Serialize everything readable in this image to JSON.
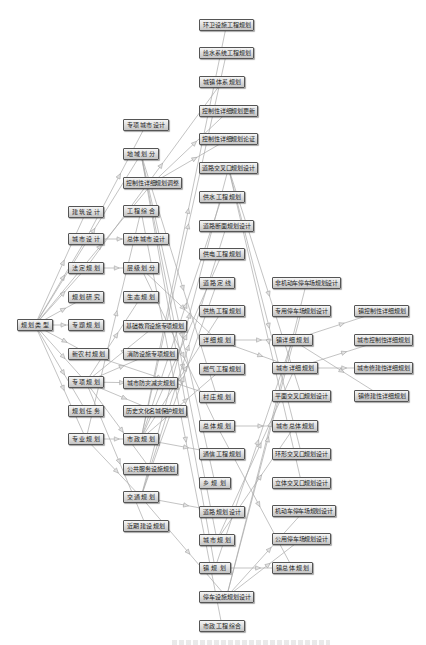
{
  "diagram": {
    "nodes": [
      {
        "id": "r0",
        "label": "规划类型"
      },
      {
        "id": "a1",
        "label": "建筑设计"
      },
      {
        "id": "a2",
        "label": "城市设计"
      },
      {
        "id": "a3",
        "label": "法定规划"
      },
      {
        "id": "a4",
        "label": "规划研究"
      },
      {
        "id": "a5",
        "label": "专题规划"
      },
      {
        "id": "a6",
        "label": "新农村规划"
      },
      {
        "id": "a7",
        "label": "专项规划"
      },
      {
        "id": "a8",
        "label": "规划任务"
      },
      {
        "id": "a9",
        "label": "专业规划"
      },
      {
        "id": "b1",
        "label": "专项城市设计"
      },
      {
        "id": "b2",
        "label": "地域划分"
      },
      {
        "id": "b3",
        "label": "控制性详细规划调整"
      },
      {
        "id": "b4",
        "label": "工程综合"
      },
      {
        "id": "b5",
        "label": "总体城市设计"
      },
      {
        "id": "b6",
        "label": "层级划分"
      },
      {
        "id": "b7",
        "label": "生态规划"
      },
      {
        "id": "b8",
        "label": "基础教育设施专项规划"
      },
      {
        "id": "b9",
        "label": "消防设施专项规划"
      },
      {
        "id": "b10",
        "label": "城市防灾减灾规划"
      },
      {
        "id": "b11",
        "label": "历史文化名城保护规划"
      },
      {
        "id": "b12",
        "label": "市政规划"
      },
      {
        "id": "b13",
        "label": "公共服务设施规划"
      },
      {
        "id": "b14",
        "label": "交通规划"
      },
      {
        "id": "b15",
        "label": "近期建设规划"
      },
      {
        "id": "c1",
        "label": "环卫设施工程规划"
      },
      {
        "id": "c2",
        "label": "给水系统工程规划"
      },
      {
        "id": "c3",
        "label": "城镇体系规划"
      },
      {
        "id": "c4",
        "label": "控制性详细规划更新"
      },
      {
        "id": "c5",
        "label": "控制性详细规划论证"
      },
      {
        "id": "c6",
        "label": "道路交叉口规划设计"
      },
      {
        "id": "c7",
        "label": "供水工程规划"
      },
      {
        "id": "c8",
        "label": "道路断面规划设计"
      },
      {
        "id": "c9",
        "label": "供电工程规划"
      },
      {
        "id": "c10",
        "label": "道路定线"
      },
      {
        "id": "c11",
        "label": "供热工程规划"
      },
      {
        "id": "c12",
        "label": "详细规划"
      },
      {
        "id": "c13",
        "label": "燃气工程规划"
      },
      {
        "id": "c14",
        "label": "村庄规划"
      },
      {
        "id": "c15",
        "label": "总体规划"
      },
      {
        "id": "c16",
        "label": "通信工程规划"
      },
      {
        "id": "c17",
        "label": "乡规划"
      },
      {
        "id": "c18",
        "label": "道路规划设计"
      },
      {
        "id": "c19",
        "label": "城市规划"
      },
      {
        "id": "c20",
        "label": "镇规划"
      },
      {
        "id": "c21",
        "label": "停车设施规划设计"
      },
      {
        "id": "c22",
        "label": "市政工程综合"
      },
      {
        "id": "d1",
        "label": "非机动车停车场规划设计"
      },
      {
        "id": "d2",
        "label": "专用停车场规划设计"
      },
      {
        "id": "d3",
        "label": "镇详细规划"
      },
      {
        "id": "d4",
        "label": "城市详细规划"
      },
      {
        "id": "d5",
        "label": "平面交叉口规划设计"
      },
      {
        "id": "d6",
        "label": "城市总体规划"
      },
      {
        "id": "d7",
        "label": "环形交叉口规划设计"
      },
      {
        "id": "d8",
        "label": "立体交叉口规划设计"
      },
      {
        "id": "d9",
        "label": "机动车停车场规划设计"
      },
      {
        "id": "d10",
        "label": "公用停车场规划设计"
      },
      {
        "id": "d11",
        "label": "镇总体规划"
      },
      {
        "id": "e1",
        "label": "镇控制性详细规划"
      },
      {
        "id": "e2",
        "label": "城市控制性详细规划"
      },
      {
        "id": "e3",
        "label": "城市修建性详细规划"
      },
      {
        "id": "e4",
        "label": "镇修建性详细规划"
      }
    ],
    "edges": [
      [
        "r0",
        "a1"
      ],
      [
        "r0",
        "a2"
      ],
      [
        "r0",
        "a3"
      ],
      [
        "r0",
        "a4"
      ],
      [
        "r0",
        "a5"
      ],
      [
        "r0",
        "a6"
      ],
      [
        "r0",
        "a7"
      ],
      [
        "r0",
        "a8"
      ],
      [
        "r0",
        "a9"
      ],
      [
        "r0",
        "b2"
      ],
      [
        "r0",
        "b3"
      ],
      [
        "a2",
        "b5"
      ],
      [
        "a2",
        "b1"
      ],
      [
        "a3",
        "b6"
      ],
      [
        "a3",
        "c3"
      ],
      [
        "a6",
        "c14"
      ],
      [
        "a7",
        "b7"
      ],
      [
        "a7",
        "b8"
      ],
      [
        "a7",
        "b9"
      ],
      [
        "a7",
        "b10"
      ],
      [
        "a7",
        "b11"
      ],
      [
        "a7",
        "b13"
      ],
      [
        "a7",
        "b15"
      ],
      [
        "a9",
        "b12"
      ],
      [
        "a9",
        "b14"
      ],
      [
        "a9",
        "b4"
      ],
      [
        "b2",
        "c19"
      ],
      [
        "b2",
        "c20"
      ],
      [
        "b2",
        "c17"
      ],
      [
        "b2",
        "c14"
      ],
      [
        "b3",
        "c4"
      ],
      [
        "b3",
        "c5"
      ],
      [
        "b4",
        "c22"
      ],
      [
        "b6",
        "c15"
      ],
      [
        "b6",
        "c12"
      ],
      [
        "b12",
        "c1"
      ],
      [
        "b12",
        "c2"
      ],
      [
        "b12",
        "c7"
      ],
      [
        "b12",
        "c9"
      ],
      [
        "b12",
        "c11"
      ],
      [
        "b12",
        "c13"
      ],
      [
        "b12",
        "c16"
      ],
      [
        "b14",
        "c6"
      ],
      [
        "b14",
        "c8"
      ],
      [
        "b14",
        "c10"
      ],
      [
        "b14",
        "c18"
      ],
      [
        "b14",
        "c21"
      ],
      [
        "c12",
        "d3"
      ],
      [
        "c12",
        "d4"
      ],
      [
        "c15",
        "d6"
      ],
      [
        "c15",
        "d11"
      ],
      [
        "c19",
        "d6"
      ],
      [
        "c19",
        "d4"
      ],
      [
        "c20",
        "d11"
      ],
      [
        "c20",
        "d3"
      ],
      [
        "c6",
        "d5"
      ],
      [
        "c6",
        "d7"
      ],
      [
        "c6",
        "d8"
      ],
      [
        "c21",
        "d1"
      ],
      [
        "c21",
        "d2"
      ],
      [
        "c21",
        "d9"
      ],
      [
        "c21",
        "d10"
      ],
      [
        "d3",
        "e1"
      ],
      [
        "d3",
        "e4"
      ],
      [
        "d4",
        "e2"
      ],
      [
        "d4",
        "e3"
      ]
    ]
  },
  "colors": {
    "node_fill_top": "#f6f6f6",
    "node_fill_bottom": "#c4c4c4",
    "node_border": "#555555",
    "edge": "#a9a9a9",
    "arrow_fill": "#e2e2e2",
    "arrow_stroke": "#9a9a9a"
  }
}
